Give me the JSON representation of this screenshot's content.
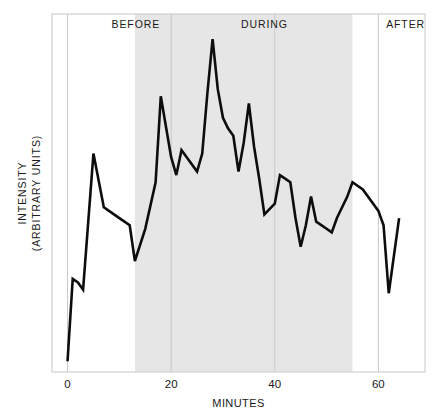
{
  "chart_data": {
    "type": "line",
    "title": "",
    "xlabel": "MINUTES",
    "ylabel_line1": "INTENSITY",
    "ylabel_line2": "(ARBITRARY UNITS)",
    "xlim": [
      -3,
      69
    ],
    "ylim": [
      0,
      100
    ],
    "xticks": [
      0,
      20,
      40,
      60
    ],
    "xticklabels": [
      "0",
      "20",
      "40",
      "60"
    ],
    "yticks": [],
    "yticklabels": [],
    "grid": "vertical-only",
    "gridline_color": "#c8c8c8",
    "frame_color": "#d0d0d0",
    "line_color": "#0d0d0d",
    "line_width": 2.6,
    "background_color": "#ffffff",
    "shaded_band": {
      "label": "DURING",
      "x_start": 13,
      "x_end": 55,
      "color": "#e6e6e6"
    },
    "annotations": [
      {
        "text": "BEFORE",
        "x": 8.5,
        "y": 96
      },
      {
        "text": "DURING",
        "x": 33.5,
        "y": 96
      },
      {
        "text": "AFTER",
        "x": 61.5,
        "y": 96
      }
    ],
    "series": [
      {
        "name": "intensity",
        "x": [
          0,
          1,
          2,
          3,
          5,
          7,
          8,
          10,
          12,
          13,
          15,
          17,
          18,
          20,
          21,
          22,
          23,
          25,
          26,
          27,
          28,
          29,
          30,
          31,
          32,
          33,
          34,
          35,
          36,
          37,
          38,
          40,
          41,
          42,
          43,
          44,
          45,
          46,
          47,
          48,
          50,
          51,
          52,
          54,
          55,
          57,
          59,
          60,
          61,
          62,
          64
        ],
        "y": [
          3,
          26,
          25,
          23,
          61,
          46,
          45,
          43,
          41,
          31,
          40,
          53,
          77,
          60,
          55,
          62,
          60,
          56,
          61,
          78,
          93,
          79,
          71,
          68,
          66,
          56,
          64,
          75,
          63,
          54,
          44,
          47,
          55,
          54,
          53,
          43,
          35,
          41,
          49,
          42,
          40,
          39,
          43,
          49,
          53,
          51,
          47,
          45,
          41,
          22,
          43
        ]
      }
    ]
  },
  "figure": {
    "plot_area": {
      "left": 52,
      "top": 14,
      "right": 425,
      "bottom": 372
    }
  }
}
